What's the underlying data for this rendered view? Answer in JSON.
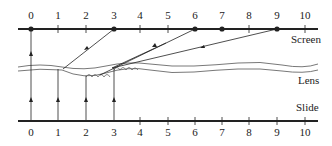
{
  "diagram": {
    "labels": {
      "screen": "Screen",
      "lens": "Lens",
      "slide": "Slide"
    },
    "screen_ticks": [
      "0",
      "1",
      "2",
      "3",
      "4",
      "5",
      "6",
      "7",
      "8",
      "9",
      "10"
    ],
    "slide_ticks": [
      "0",
      "1",
      "2",
      "3",
      "4",
      "5",
      "6",
      "7",
      "8",
      "9",
      "10"
    ],
    "screen_dots": [
      "0",
      "3",
      "6",
      "7",
      "9"
    ],
    "rays": [
      {
        "from_slide": "0",
        "to_screen": "0"
      },
      {
        "from_slide": "1",
        "to_screen": "3"
      },
      {
        "from_slide": "2",
        "to_screen": "6"
      },
      {
        "from_slide": "3",
        "to_screen": "9"
      }
    ],
    "colors": {
      "line": "#222222",
      "lens": "#555555",
      "background": "#ffffff"
    }
  }
}
